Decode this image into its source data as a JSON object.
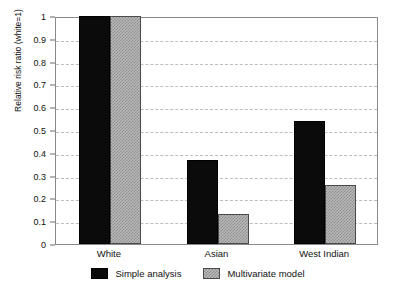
{
  "chart_data": {
    "type": "bar",
    "title": "",
    "subtitle": "",
    "xlabel": "",
    "ylabel": "Relative risk ratio (white=1)",
    "categories": [
      "White",
      "Asian",
      "West Indian"
    ],
    "series": [
      {
        "name": "Simple analysis",
        "values": [
          1.0,
          0.37,
          0.54
        ],
        "color": "#0b0b0b",
        "pattern": "solid-black"
      },
      {
        "name": "Multivariate model",
        "values": [
          1.0,
          0.13,
          0.26
        ],
        "color": "#b9b9b9",
        "pattern": "checkerboard-gray"
      }
    ],
    "ylim": [
      0,
      1
    ],
    "ytick_values": [
      0,
      0.1,
      0.2,
      0.3,
      0.4,
      0.5,
      0.6,
      0.7,
      0.8,
      0.9,
      1
    ],
    "ytick_labels": [
      "0",
      "0.1",
      "0.2",
      "0.3",
      "0.4",
      "0.5",
      "0.6",
      "0.7",
      "0.8",
      "0.9",
      "1"
    ],
    "grid": true,
    "grid_axis": "y",
    "grid_style": "dashed",
    "grid_color": "#bdbdbd",
    "legend_position": "bottom-center",
    "frame": true,
    "frame_color": "#8a8a8a",
    "background_color": "#ffffff"
  }
}
